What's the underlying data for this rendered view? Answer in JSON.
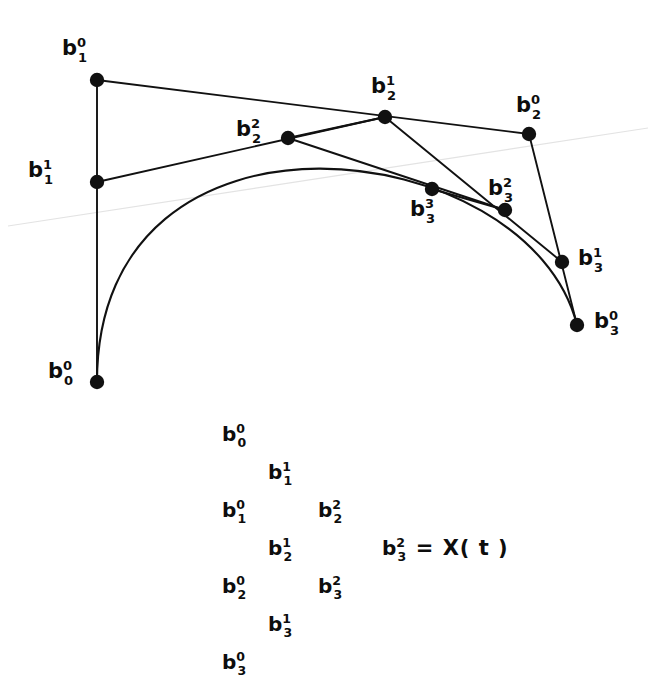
{
  "figure": {
    "canvas": {
      "width": 648,
      "height": 680
    },
    "colors": {
      "ink": "#111111",
      "background": "#ffffff",
      "faint_line": "#e3e3e3"
    },
    "points": [
      {
        "name": "b_0^0",
        "base": "b",
        "sup": "0",
        "sub": "0",
        "x": 97,
        "y": 382,
        "label_x": 48,
        "label_y": 361,
        "dot": true
      },
      {
        "name": "b_1^0",
        "base": "b",
        "sup": "0",
        "sub": "1",
        "x": 97,
        "y": 80,
        "label_x": 62,
        "label_y": 38,
        "dot": true
      },
      {
        "name": "b_2^0",
        "base": "b",
        "sup": "0",
        "sub": "2",
        "x": 529,
        "y": 134,
        "label_x": 516,
        "label_y": 95,
        "dot": true
      },
      {
        "name": "b_3^0",
        "base": "b",
        "sup": "0",
        "sub": "3",
        "x": 577,
        "y": 325,
        "label_x": 594,
        "label_y": 311,
        "dot": true
      },
      {
        "name": "b_1^1",
        "base": "b",
        "sup": "1",
        "sub": "1",
        "x": 97,
        "y": 182,
        "label_x": 28,
        "label_y": 160,
        "dot": true
      },
      {
        "name": "b_2^1",
        "base": "b",
        "sup": "1",
        "sub": "2",
        "x": 385,
        "y": 117,
        "label_x": 371,
        "label_y": 76,
        "dot": true
      },
      {
        "name": "b_3^1",
        "base": "b",
        "sup": "1",
        "sub": "3",
        "x": 562,
        "y": 262,
        "label_x": 578,
        "label_y": 248,
        "dot": true
      },
      {
        "name": "b_2^2",
        "base": "b",
        "sup": "2",
        "sub": "2",
        "x": 288,
        "y": 138,
        "label_x": 236,
        "label_y": 119,
        "dot": true
      },
      {
        "name": "b_3^2",
        "base": "b",
        "sup": "2",
        "sub": "3",
        "x": 505,
        "y": 210,
        "label_x": 488,
        "label_y": 178,
        "dot": true
      },
      {
        "name": "b_3^3",
        "base": "b",
        "sup": "3",
        "sub": "3",
        "x": 432,
        "y": 189,
        "label_x": 410,
        "label_y": 199,
        "dot": true
      }
    ],
    "polylines": [
      {
        "name": "control-polygon-level-0",
        "pts": "97,80 97,382"
      },
      {
        "name": "control-polygon-level-0b",
        "pts": "97,80 529,134 577,325"
      },
      {
        "name": "control-polygon-level-1",
        "pts": "97,182 385,117 562,262"
      },
      {
        "name": "control-polygon-level-2",
        "pts": "288,138 505,210"
      },
      {
        "name": "control-polygon-level-1b",
        "pts": "288,138 385,117"
      },
      {
        "name": "tangent-chord",
        "pts": "432,189 505,210"
      }
    ],
    "bezier_curve": {
      "name": "cubic-bezier-curve",
      "start": [
        97,
        382
      ],
      "control1": [
        97,
        80
      ],
      "control2": [
        529,
        134
      ],
      "end": [
        577,
        325
      ]
    },
    "faint_line": {
      "name": "scan-artifact-line",
      "x1": 8,
      "y1": 226,
      "x2": 648,
      "y2": 128
    }
  },
  "scheme": {
    "name": "de-casteljau-triangular-scheme",
    "entries": [
      {
        "base": "b",
        "sup": "0",
        "sub": "0",
        "x": 222,
        "y": 424
      },
      {
        "base": "b",
        "sup": "1",
        "sub": "1",
        "x": 268,
        "y": 462
      },
      {
        "base": "b",
        "sup": "0",
        "sub": "1",
        "x": 222,
        "y": 500
      },
      {
        "base": "b",
        "sup": "2",
        "sub": "2",
        "x": 318,
        "y": 500
      },
      {
        "base": "b",
        "sup": "1",
        "sub": "2",
        "x": 268,
        "y": 538
      },
      {
        "base": "b",
        "sup": "0",
        "sub": "2",
        "x": 222,
        "y": 576
      },
      {
        "base": "b",
        "sup": "2",
        "sub": "3",
        "x": 318,
        "y": 576
      },
      {
        "base": "b",
        "sup": "1",
        "sub": "3",
        "x": 268,
        "y": 614
      },
      {
        "base": "b",
        "sup": "0",
        "sub": "3",
        "x": 222,
        "y": 652
      }
    ],
    "result": {
      "base": "b",
      "sup": "2",
      "sub": "3",
      "equals": "= X( t )",
      "x": 382,
      "y": 538
    }
  }
}
